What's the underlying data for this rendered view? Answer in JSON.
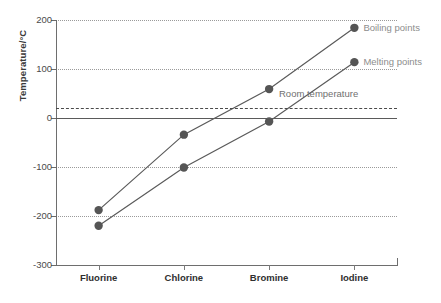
{
  "chart_data": {
    "type": "line",
    "title": "",
    "xlabel": "",
    "ylabel": "Temperature/°C",
    "categories": [
      "Fluorine",
      "Chlorine",
      "Bromine",
      "Iodine"
    ],
    "series": [
      {
        "name": "Boiling points",
        "values": [
          -188,
          -34,
          59,
          184
        ]
      },
      {
        "name": "Melting points",
        "values": [
          -220,
          -101,
          -7,
          114
        ]
      }
    ],
    "ylim": [
      -300,
      200
    ],
    "yticks": [
      200,
      100,
      0,
      -100,
      -200,
      -300
    ],
    "ytick_labels": [
      "200",
      "100",
      "0",
      "-100",
      "-200",
      "-300"
    ],
    "grid": "horizontal-dotted",
    "legend_position": "inline-right",
    "annotations": [
      {
        "name": "room-temperature",
        "label": "Room temperature",
        "value": 20,
        "style": "dashed-horizontal-line"
      },
      {
        "name": "zero-line",
        "label": "",
        "value": 0,
        "style": "solid-horizontal-line"
      }
    ],
    "marker_color": "#555555",
    "line_color": "#5a5a5a",
    "grid_color": "#9a9a9a",
    "label_color": "#8d8d8d"
  },
  "axis": {
    "y_title": "Temperature/°C"
  },
  "caption": {
    "text": ""
  }
}
